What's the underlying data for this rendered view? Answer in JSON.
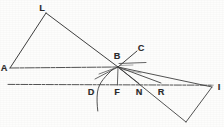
{
  "figure": {
    "width": 224,
    "height": 127,
    "background_color": "#fdfdfc",
    "ink_color": "#3a3a3a",
    "labels": [
      {
        "id": "L",
        "text": "L",
        "x": 42,
        "y": 8
      },
      {
        "id": "A",
        "text": "A",
        "x": 4,
        "y": 68
      },
      {
        "id": "C",
        "text": "C",
        "x": 141,
        "y": 48
      },
      {
        "id": "B",
        "text": "B",
        "x": 117,
        "y": 56
      },
      {
        "id": "D",
        "text": "D",
        "x": 91,
        "y": 92
      },
      {
        "id": "F",
        "text": "F",
        "x": 117,
        "y": 92
      },
      {
        "id": "N",
        "text": "N",
        "x": 139,
        "y": 92
      },
      {
        "id": "R",
        "text": "R",
        "x": 161,
        "y": 92
      },
      {
        "id": "I",
        "text": "I",
        "x": 219,
        "y": 87
      }
    ],
    "points": {
      "A": {
        "x": 10,
        "y": 68
      },
      "L": {
        "x": 46,
        "y": 13
      },
      "B": {
        "x": 118,
        "y": 67
      },
      "C_end": {
        "x": 137,
        "y": 51
      },
      "D": {
        "x": 91,
        "y": 84
      },
      "F": {
        "x": 117,
        "y": 84
      },
      "N": {
        "x": 139,
        "y": 84
      },
      "R": {
        "x": 160,
        "y": 84
      },
      "I": {
        "x": 212,
        "y": 87
      },
      "T": {
        "x": 186,
        "y": 122
      },
      "stub_end": {
        "x": 146,
        "y": 62
      },
      "arc_top": {
        "x": 113,
        "y": 70
      },
      "arc_bottom": {
        "x": 97,
        "y": 111
      },
      "baseline_left": {
        "x": 8,
        "y": 84
      },
      "baseline_right": {
        "x": 213,
        "y": 85
      }
    },
    "segments": [
      {
        "name": "segment-A-L",
        "from": "A",
        "to": "L"
      },
      {
        "name": "segment-L-B",
        "from": "L",
        "to": "B"
      },
      {
        "name": "segment-A-B",
        "from": "A",
        "to": "B"
      },
      {
        "name": "segment-B-C",
        "from": "B",
        "to": "C_end"
      },
      {
        "name": "segment-B-stub",
        "from": "B",
        "to": "stub_end"
      },
      {
        "name": "segment-B-I",
        "from": "B",
        "to": "I"
      },
      {
        "name": "segment-B-R",
        "from": "B",
        "to": "R"
      },
      {
        "name": "segment-B-N",
        "from": "B",
        "to": "N"
      },
      {
        "name": "segment-B-T",
        "from": "B",
        "to": "T"
      },
      {
        "name": "segment-B-F",
        "from": "B",
        "to": "F"
      },
      {
        "name": "segment-B-D",
        "from": "B",
        "to": "D"
      },
      {
        "name": "segment-I-T",
        "from": "I",
        "to": "T"
      },
      {
        "name": "baseline",
        "from": "baseline_left",
        "to": "baseline_right"
      }
    ],
    "arc": {
      "name": "refraction-arc",
      "description": "curve through D-F region crossing baseline"
    }
  }
}
